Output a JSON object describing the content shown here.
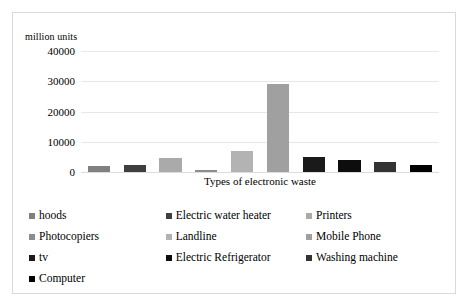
{
  "chart_data": {
    "type": "bar",
    "title": "",
    "subtitle": "",
    "ylabel": "million units",
    "xlabel": "Types of electronic waste",
    "ylim": [
      0,
      40000
    ],
    "yticks": [
      40000,
      30000,
      20000,
      10000,
      0
    ],
    "ytick_labels": [
      "40000",
      "30000",
      "20000",
      "10000",
      "0"
    ],
    "grid": true,
    "legend_position": "bottom",
    "categories": [
      "hoods",
      "Electric water heater",
      "Printers",
      "Photocopiers",
      "Landline",
      "Mobile Phone",
      "tv",
      "Electric Refrigerator",
      "Washing machine",
      "Computer"
    ],
    "values": [
      2000,
      2200,
      4600,
      600,
      7000,
      29000,
      5000,
      4100,
      3400,
      2400
    ],
    "colors": [
      "#808080",
      "#3f3f3f",
      "#aaaaaa",
      "#8c8c8c",
      "#b3b3b3",
      "#a0a0a0",
      "#1a1a1a",
      "#0d0d0d",
      "#333333",
      "#000000"
    ],
    "series": [
      {
        "name": "million units",
        "values": [
          2000,
          2200,
          4600,
          600,
          7000,
          29000,
          5000,
          4100,
          3400,
          2400
        ]
      }
    ]
  },
  "legend": {
    "rows": [
      [
        {
          "label": "hoods",
          "color": "#808080"
        },
        {
          "label": "Electric water heater",
          "color": "#3f3f3f"
        },
        {
          "label": "Printers",
          "color": "#aaaaaa"
        }
      ],
      [
        {
          "label": "Photocopiers",
          "color": "#8c8c8c"
        },
        {
          "label": "Landline",
          "color": "#b3b3b3"
        },
        {
          "label": "Mobile Phone",
          "color": "#a0a0a0"
        }
      ],
      [
        {
          "label": "tv",
          "color": "#1a1a1a"
        },
        {
          "label": "Electric Refrigerator",
          "color": "#0d0d0d"
        },
        {
          "label": "Washing machine",
          "color": "#333333"
        }
      ],
      [
        {
          "label": "Computer",
          "color": "#000000"
        }
      ]
    ]
  },
  "style": {
    "border_color": "#d9d9d9",
    "gridline_color": "#e8e8e8",
    "background": "#ffffff",
    "text_color": "#000000"
  }
}
